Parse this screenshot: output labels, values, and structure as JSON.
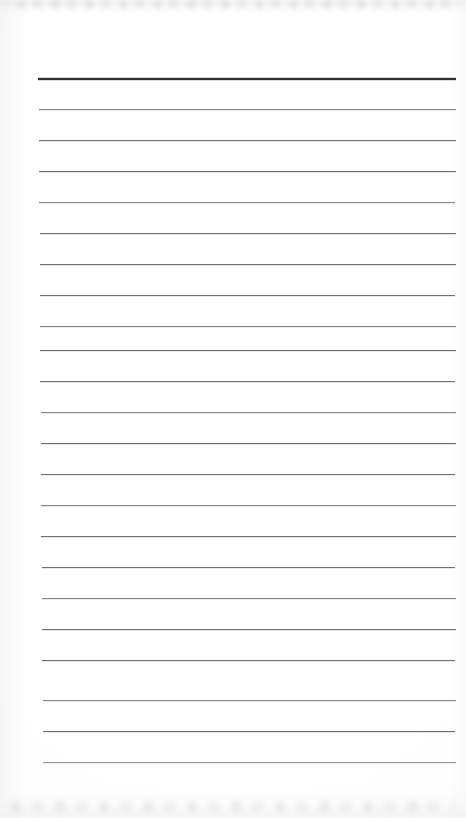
{
  "document": {
    "kind": "blank-ruled-paper-scan",
    "title": "Blank ruled notebook page",
    "page_width": 466,
    "page_height": 818,
    "background_color": "#ffffff",
    "paper_tone": "#fdfdfd",
    "text_content": "",
    "handwriting_present": "no",
    "printed_text_present": "no"
  },
  "ruling": {
    "style": "wide-ruled horizontal lines",
    "line_count": 23,
    "first_line_y": 78,
    "last_line_y": 762,
    "line_spacing": 31.1,
    "left_margin_x": 38,
    "right_margin_x": 456,
    "line_length": 418,
    "header_rule_color": "#2f2f33",
    "header_rule_thickness": 2,
    "body_rule_color": "#6f6f73",
    "body_rule_thickness": 1,
    "vertical_margin_rule": "none",
    "lines": [
      {
        "index": 1,
        "y": 78,
        "weight": "header",
        "x_start": 38,
        "x_end": 456
      },
      {
        "index": 2,
        "y": 109,
        "weight": "faint",
        "x_start": 39,
        "x_end": 456
      },
      {
        "index": 3,
        "y": 140,
        "weight": "normal",
        "x_start": 39,
        "x_end": 456
      },
      {
        "index": 4,
        "y": 171,
        "weight": "normal",
        "x_start": 39,
        "x_end": 456
      },
      {
        "index": 5,
        "y": 202,
        "weight": "faint",
        "x_start": 39,
        "x_end": 455
      },
      {
        "index": 6,
        "y": 233,
        "weight": "normal",
        "x_start": 40,
        "x_end": 456
      },
      {
        "index": 7,
        "y": 264,
        "weight": "normal",
        "x_start": 40,
        "x_end": 456
      },
      {
        "index": 8,
        "y": 295,
        "weight": "normal",
        "x_start": 40,
        "x_end": 455
      },
      {
        "index": 9,
        "y": 326,
        "weight": "faint",
        "x_start": 40,
        "x_end": 456
      },
      {
        "index": 10,
        "y": 350,
        "weight": "normal",
        "x_start": 40,
        "x_end": 456
      },
      {
        "index": 11,
        "y": 381,
        "weight": "normal",
        "x_start": 40,
        "x_end": 455
      },
      {
        "index": 12,
        "y": 412,
        "weight": "faint",
        "x_start": 41,
        "x_end": 456
      },
      {
        "index": 13,
        "y": 443,
        "weight": "normal",
        "x_start": 41,
        "x_end": 456
      },
      {
        "index": 14,
        "y": 474,
        "weight": "normal",
        "x_start": 41,
        "x_end": 455
      },
      {
        "index": 15,
        "y": 505,
        "weight": "faint",
        "x_start": 41,
        "x_end": 456
      },
      {
        "index": 16,
        "y": 536,
        "weight": "normal",
        "x_start": 41,
        "x_end": 456
      },
      {
        "index": 17,
        "y": 567,
        "weight": "normal",
        "x_start": 42,
        "x_end": 455
      },
      {
        "index": 18,
        "y": 598,
        "weight": "faint",
        "x_start": 42,
        "x_end": 456
      },
      {
        "index": 19,
        "y": 629,
        "weight": "normal",
        "x_start": 42,
        "x_end": 456
      },
      {
        "index": 20,
        "y": 660,
        "weight": "normal",
        "x_start": 42,
        "x_end": 455
      },
      {
        "index": 21,
        "y": 700,
        "weight": "faint",
        "x_start": 43,
        "x_end": 456
      },
      {
        "index": 22,
        "y": 731,
        "weight": "normal",
        "x_start": 43,
        "x_end": 455
      },
      {
        "index": 23,
        "y": 762,
        "weight": "very-faint",
        "x_start": 43,
        "x_end": 456
      }
    ]
  },
  "artifacts": {
    "top_smudge": "faint gray scanner band across top edge",
    "bottom_smudge": "faint gray scanner band across bottom edge",
    "left_edge_shading": "subtle light-gray falloff at left margin",
    "right_edge_shading": "subtle light-gray falloff at right margin"
  }
}
